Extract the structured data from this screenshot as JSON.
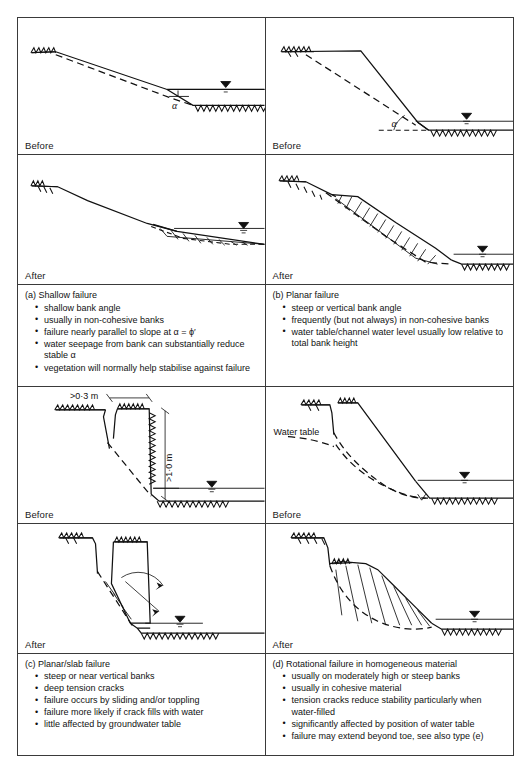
{
  "figure": {
    "stage_before": "Before",
    "stage_after": "After",
    "panels": [
      {
        "id": "a",
        "title": "(a) Shallow failure",
        "bullets": [
          "shallow bank angle",
          "usually in non-cohesive banks",
          "failure nearly parallel to slope at α = ϕ′",
          "water seepage from bank can substantially reduce stable α",
          "vegetation will normally help stabilise against failure"
        ],
        "diagram_labels": {
          "angle": "α"
        }
      },
      {
        "id": "b",
        "title": "(b) Planar failure",
        "bullets": [
          "steep or vertical bank angle",
          "frequently (but not always) in non-cohesive banks",
          "water table/channel water level usually low relative to total bank height"
        ],
        "diagram_labels": {
          "angle": "α"
        }
      },
      {
        "id": "c",
        "title": "(c) Planar/slab failure",
        "bullets": [
          "steep or near vertical banks",
          "deep tension cracks",
          "failure occurs by sliding and/or toppling",
          "failure more likely if crack fills with water",
          "little affected by groundwater table"
        ],
        "diagram_labels": {
          "crack_width": ">0·0 m",
          "crack_width_actual": ">0·3 m",
          "bank_height": ">1·0 m"
        }
      },
      {
        "id": "d",
        "title": "(d) Rotational failure in homogeneous material",
        "bullets": [
          "usually on moderately high or steep banks",
          "usually in cohesive material",
          "tension cracks reduce stability particularly when water-filled",
          "significantly affected by position of water table",
          "failure may extend beyond toe, see also type (e)"
        ],
        "diagram_labels": {
          "water_table": "Water\ntable"
        }
      }
    ]
  },
  "colors": {
    "ink": "#111111",
    "border": "#3a3a3a",
    "background": "#ffffff"
  }
}
